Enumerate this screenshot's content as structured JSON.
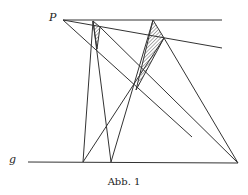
{
  "figure": {
    "caption": "Abb. 1",
    "labels": {
      "point": "P",
      "line": "g"
    },
    "colors": {
      "stroke": "#333333",
      "background": "#ffffff"
    }
  }
}
